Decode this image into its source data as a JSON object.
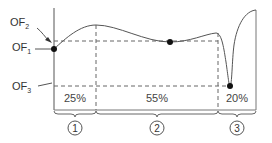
{
  "labels": {
    "of1": {
      "main": "OF",
      "sub": "1"
    },
    "of2": {
      "main": "OF",
      "sub": "2"
    },
    "of3": {
      "main": "OF",
      "sub": "3"
    }
  },
  "segments": [
    {
      "percent": "25%",
      "number": "1"
    },
    {
      "percent": "55%",
      "number": "2"
    },
    {
      "percent": "20%",
      "number": "3"
    }
  ],
  "colors": {
    "line": "#555555",
    "dot": "#111111",
    "text": "#333333"
  }
}
